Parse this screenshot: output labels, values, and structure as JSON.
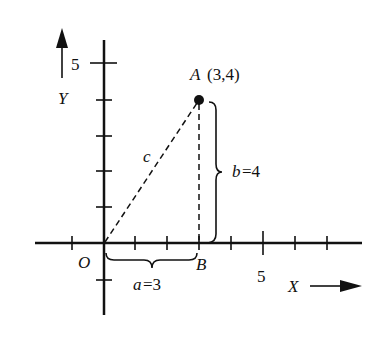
{
  "diagram": {
    "colors": {
      "ink": "#111111",
      "background": "#ffffff"
    },
    "axes": {
      "x_label": "X",
      "y_label": "Y",
      "origin_label": "O",
      "x_tick_label": "5",
      "y_tick_label": "5",
      "x_range": [
        -1,
        7
      ],
      "y_range": [
        -1,
        5
      ]
    },
    "points": {
      "A": {
        "label": "A",
        "coords_text": "(3,4)",
        "x": 3,
        "y": 4
      },
      "B": {
        "label": "B",
        "x": 3,
        "y": 0
      },
      "O": {
        "label": "O",
        "x": 0,
        "y": 0
      }
    },
    "segments": {
      "hypotenuse": {
        "label": "c",
        "style": "dashed"
      },
      "vertical": {
        "style": "dashed"
      }
    },
    "braces": {
      "horizontal": {
        "var": "a",
        "eq": "=3"
      },
      "vertical": {
        "var": "b",
        "eq": "=4"
      }
    }
  }
}
